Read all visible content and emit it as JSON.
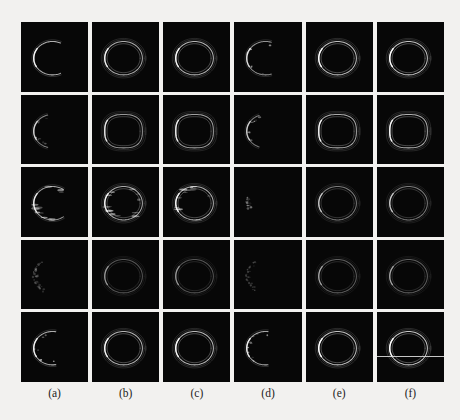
{
  "figure": {
    "watermark_text": "",
    "background_color": "#f2f1ef",
    "panel_background": "#070707",
    "stroke_color": "#ffffff",
    "rows": 5,
    "columns": 6,
    "column_labels": [
      {
        "text": "(a)"
      },
      {
        "text": "(b)"
      },
      {
        "text": "(c)"
      },
      {
        "text": "(d)"
      },
      {
        "text": "(e)"
      },
      {
        "text": "(f)"
      }
    ]
  },
  "chart_data": {
    "type": "heatmap",
    "title": "",
    "xlabel": "",
    "ylabel": "",
    "grid": false,
    "legend": "none",
    "categories": [
      "(a)",
      "(b)",
      "(c)",
      "(d)",
      "(e)",
      "(f)"
    ],
    "row_index": [
      1,
      2,
      3,
      4,
      5
    ],
    "panels": [
      {
        "row": 1,
        "col": "(a)",
        "shape": "open-arc",
        "arc_coverage_deg": 230,
        "brightness": 0.72,
        "double_contour": false,
        "artifact": "none"
      },
      {
        "row": 1,
        "col": "(b)",
        "shape": "closed-ellipse",
        "arc_coverage_deg": 360,
        "brightness": 0.7,
        "double_contour": true,
        "artifact": "none"
      },
      {
        "row": 1,
        "col": "(c)",
        "shape": "closed-ellipse",
        "arc_coverage_deg": 360,
        "brightness": 0.74,
        "double_contour": true,
        "artifact": "none"
      },
      {
        "row": 1,
        "col": "(d)",
        "shape": "open-arc",
        "arc_coverage_deg": 215,
        "brightness": 0.6,
        "double_contour": false,
        "artifact": "speckle"
      },
      {
        "row": 1,
        "col": "(e)",
        "shape": "closed-ellipse",
        "arc_coverage_deg": 360,
        "brightness": 0.78,
        "double_contour": true,
        "artifact": "none"
      },
      {
        "row": 1,
        "col": "(f)",
        "shape": "closed-ellipse",
        "arc_coverage_deg": 360,
        "brightness": 0.8,
        "double_contour": true,
        "artifact": "none"
      },
      {
        "row": 2,
        "col": "(a)",
        "shape": "open-arc",
        "arc_coverage_deg": 150,
        "brightness": 0.55,
        "double_contour": false,
        "artifact": "speckle"
      },
      {
        "row": 2,
        "col": "(b)",
        "shape": "closed-rounded-rect",
        "arc_coverage_deg": 360,
        "brightness": 0.62,
        "double_contour": true,
        "artifact": "none"
      },
      {
        "row": 2,
        "col": "(c)",
        "shape": "closed-rounded-rect",
        "arc_coverage_deg": 360,
        "brightness": 0.66,
        "double_contour": true,
        "artifact": "none"
      },
      {
        "row": 2,
        "col": "(d)",
        "shape": "open-arc",
        "arc_coverage_deg": 140,
        "brightness": 0.52,
        "double_contour": false,
        "artifact": "speckle"
      },
      {
        "row": 2,
        "col": "(e)",
        "shape": "closed-rounded-rect",
        "arc_coverage_deg": 360,
        "brightness": 0.7,
        "double_contour": true,
        "artifact": "none"
      },
      {
        "row": 2,
        "col": "(f)",
        "shape": "closed-rounded-rect",
        "arc_coverage_deg": 360,
        "brightness": 0.72,
        "double_contour": true,
        "artifact": "none"
      },
      {
        "row": 3,
        "col": "(a)",
        "shape": "open-arc",
        "arc_coverage_deg": 250,
        "brightness": 0.66,
        "double_contour": false,
        "artifact": "streaks"
      },
      {
        "row": 3,
        "col": "(b)",
        "shape": "closed-ellipse",
        "arc_coverage_deg": 360,
        "brightness": 0.7,
        "double_contour": true,
        "artifact": "streaks"
      },
      {
        "row": 3,
        "col": "(c)",
        "shape": "closed-ellipse",
        "arc_coverage_deg": 360,
        "brightness": 0.72,
        "double_contour": true,
        "artifact": "streaks"
      },
      {
        "row": 3,
        "col": "(d)",
        "shape": "sparse-points",
        "arc_coverage_deg": 40,
        "brightness": 0.35,
        "double_contour": false,
        "artifact": "speckle"
      },
      {
        "row": 3,
        "col": "(e)",
        "shape": "closed-ellipse",
        "arc_coverage_deg": 360,
        "brightness": 0.5,
        "double_contour": true,
        "artifact": "none"
      },
      {
        "row": 3,
        "col": "(f)",
        "shape": "closed-ellipse",
        "arc_coverage_deg": 360,
        "brightness": 0.5,
        "double_contour": true,
        "artifact": "none"
      },
      {
        "row": 4,
        "col": "(a)",
        "shape": "sparse-arc",
        "arc_coverage_deg": 120,
        "brightness": 0.28,
        "double_contour": false,
        "artifact": "speckle"
      },
      {
        "row": 4,
        "col": "(b)",
        "shape": "closed-ellipse",
        "arc_coverage_deg": 360,
        "brightness": 0.34,
        "double_contour": true,
        "artifact": "none"
      },
      {
        "row": 4,
        "col": "(c)",
        "shape": "closed-ellipse",
        "arc_coverage_deg": 360,
        "brightness": 0.34,
        "double_contour": true,
        "artifact": "none"
      },
      {
        "row": 4,
        "col": "(d)",
        "shape": "sparse-arc",
        "arc_coverage_deg": 110,
        "brightness": 0.22,
        "double_contour": false,
        "artifact": "speckle"
      },
      {
        "row": 4,
        "col": "(e)",
        "shape": "closed-ellipse",
        "arc_coverage_deg": 360,
        "brightness": 0.38,
        "double_contour": true,
        "artifact": "none"
      },
      {
        "row": 4,
        "col": "(f)",
        "shape": "closed-ellipse",
        "arc_coverage_deg": 360,
        "brightness": 0.38,
        "double_contour": true,
        "artifact": "none"
      },
      {
        "row": 5,
        "col": "(a)",
        "shape": "open-arc",
        "arc_coverage_deg": 200,
        "brightness": 0.7,
        "double_contour": false,
        "artifact": "speckle"
      },
      {
        "row": 5,
        "col": "(b)",
        "shape": "closed-ellipse",
        "arc_coverage_deg": 360,
        "brightness": 0.74,
        "double_contour": true,
        "artifact": "none"
      },
      {
        "row": 5,
        "col": "(c)",
        "shape": "closed-ellipse",
        "arc_coverage_deg": 360,
        "brightness": 0.76,
        "double_contour": true,
        "artifact": "none"
      },
      {
        "row": 5,
        "col": "(d)",
        "shape": "open-arc",
        "arc_coverage_deg": 195,
        "brightness": 0.68,
        "double_contour": false,
        "artifact": "speckle"
      },
      {
        "row": 5,
        "col": "(e)",
        "shape": "closed-ellipse",
        "arc_coverage_deg": 360,
        "brightness": 0.8,
        "double_contour": true,
        "artifact": "none"
      },
      {
        "row": 5,
        "col": "(f)",
        "shape": "closed-ellipse",
        "arc_coverage_deg": 360,
        "brightness": 0.82,
        "double_contour": true,
        "artifact": "scanline"
      }
    ]
  }
}
